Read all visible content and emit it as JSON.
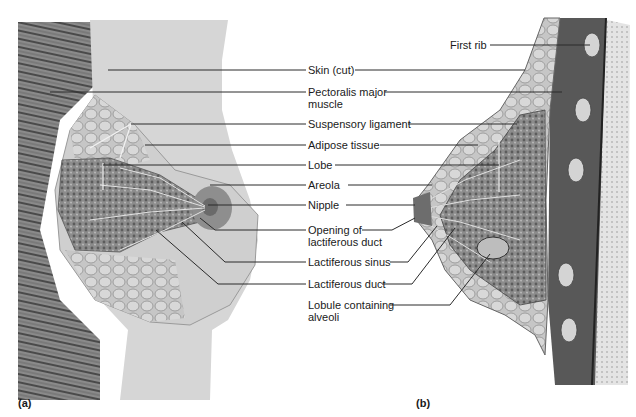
{
  "figure": {
    "panels": [
      {
        "id": "a",
        "label": "(a)",
        "view": "anterior view"
      },
      {
        "id": "b",
        "label": "(b)",
        "view": "sagittal section"
      }
    ],
    "labels": {
      "first_rib": "First rib",
      "skin_cut": "Skin (cut)",
      "pectoralis_1": "Pectoralis major",
      "pectoralis_2": "muscle",
      "suspensory_ligament": "Suspensory ligament",
      "adipose_tissue": "Adipose tissue",
      "lobe": "Lobe",
      "areola": "Areola",
      "nipple": "Nipple",
      "opening_1": "Opening of",
      "opening_2": "lactiferous duct",
      "lactiferous_sinus": "Lactiferous sinus",
      "lactiferous_duct": "Lactiferous duct",
      "lobule_1": "Lobule containing",
      "lobule_2": "alveoli"
    },
    "colors": {
      "line": "#2a2a2a",
      "skin": "#d9d9d9",
      "muscle": "#5a5a5a",
      "gland": "#7d7d7d",
      "fat": "#bcbcbc"
    }
  }
}
